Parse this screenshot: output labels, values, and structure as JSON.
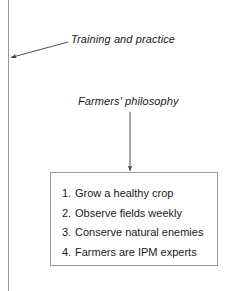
{
  "figure": {
    "page_rule_color": "#9a9a9a",
    "box_border_color": "#9a9a9a",
    "text_color": "#1a1a1a",
    "background": "#ffffff"
  },
  "labels": {
    "training": "Training and practice",
    "philosophy": "Farmers' philosophy"
  },
  "arrows": [
    {
      "name": "training-to-margin-arrow",
      "from": "Training and practice",
      "to": "left margin",
      "direction": "down-left"
    },
    {
      "name": "philosophy-to-principles-arrow",
      "from": "Farmers' philosophy",
      "to": "principles box",
      "direction": "down"
    }
  ],
  "principles": {
    "items": [
      {
        "number": "1.",
        "text": "Grow a healthy crop"
      },
      {
        "number": "2.",
        "text": "Observe fields weekly"
      },
      {
        "number": "3.",
        "text": "Conserve natural enemies"
      },
      {
        "number": "4.",
        "text": "Farmers are IPM experts"
      }
    ]
  }
}
